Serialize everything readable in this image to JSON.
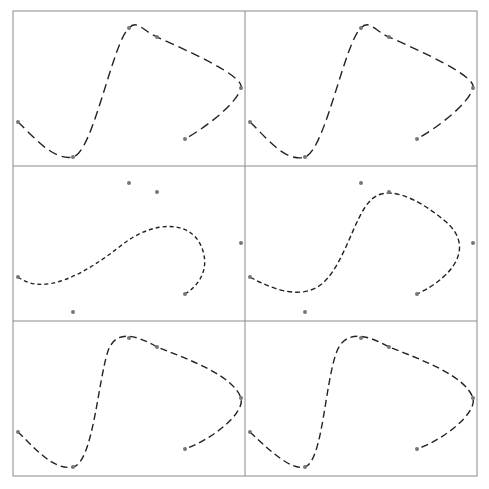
{
  "chart_data": {
    "type": "line",
    "title": "",
    "xlabel": "",
    "ylabel": "",
    "layout": {
      "rows": 3,
      "cols": 2,
      "grid": false,
      "legend": "none",
      "axes_ticks": "none"
    },
    "note": "Six control points (gray markers) shown in every panel; each panel draws a dashed interpolating spline through them with different tension/parameterization. Coordinates are panel-local pixels (panel box 232x155, origin top-left).",
    "control_points": [
      [
        5,
        111
      ],
      [
        60,
        146
      ],
      [
        116,
        17
      ],
      [
        144,
        26
      ],
      [
        228,
        77
      ],
      [
        172,
        128
      ]
    ],
    "panels": [
      {
        "id": "r1c1",
        "row": 0,
        "col": 0,
        "dash": "9,5",
        "through_points": true,
        "path": "M5,111 C20,125 40,150 60,146 C80,142 100,30 116,17 C124,8 130,20 144,26 C175,40 232,65 228,77 C224,92 195,115 172,128"
      },
      {
        "id": "r1c2",
        "row": 0,
        "col": 1,
        "dash": "9,5",
        "through_points": true,
        "path": "M5,111 C20,125 40,152 60,146 C80,140 100,30 116,17 C124,8 130,20 144,26 C175,40 232,65 228,77 C224,92 195,115 172,128"
      },
      {
        "id": "r2c1",
        "row": 1,
        "col": 0,
        "dash": "4,3",
        "through_points": false,
        "path": "M5,111 C30,130 70,110 110,78 C140,55 180,52 190,85 C196,105 185,120 172,128"
      },
      {
        "id": "r2c2",
        "row": 1,
        "col": 1,
        "dash": "5,3",
        "through_points": false,
        "path": "M5,111 C30,125 60,135 80,115 C100,95 110,50 125,35 C140,18 170,30 200,55 C230,80 210,110 172,128"
      },
      {
        "id": "r3c1",
        "row": 2,
        "col": 0,
        "dash": "7,4",
        "through_points": true,
        "path": "M5,111 C20,125 40,150 60,146 C80,142 85,60 95,30 C102,10 120,12 144,26 C180,40 220,55 228,77 C232,92 200,118 172,128"
      },
      {
        "id": "r3c2",
        "row": 2,
        "col": 1,
        "dash": "7,4",
        "through_points": true,
        "path": "M5,111 C20,125 45,150 60,146 C78,140 80,60 92,30 C100,10 120,12 144,26 C180,40 220,55 228,77 C232,92 200,118 172,128"
      }
    ]
  },
  "frame": {
    "left": 13,
    "top": 11,
    "panel_width": 232,
    "panel_height": 155,
    "line_color": "#8a8a8a"
  },
  "style": {
    "curve_color": "#222222",
    "marker_color": "#777777",
    "marker_radius": 2
  }
}
